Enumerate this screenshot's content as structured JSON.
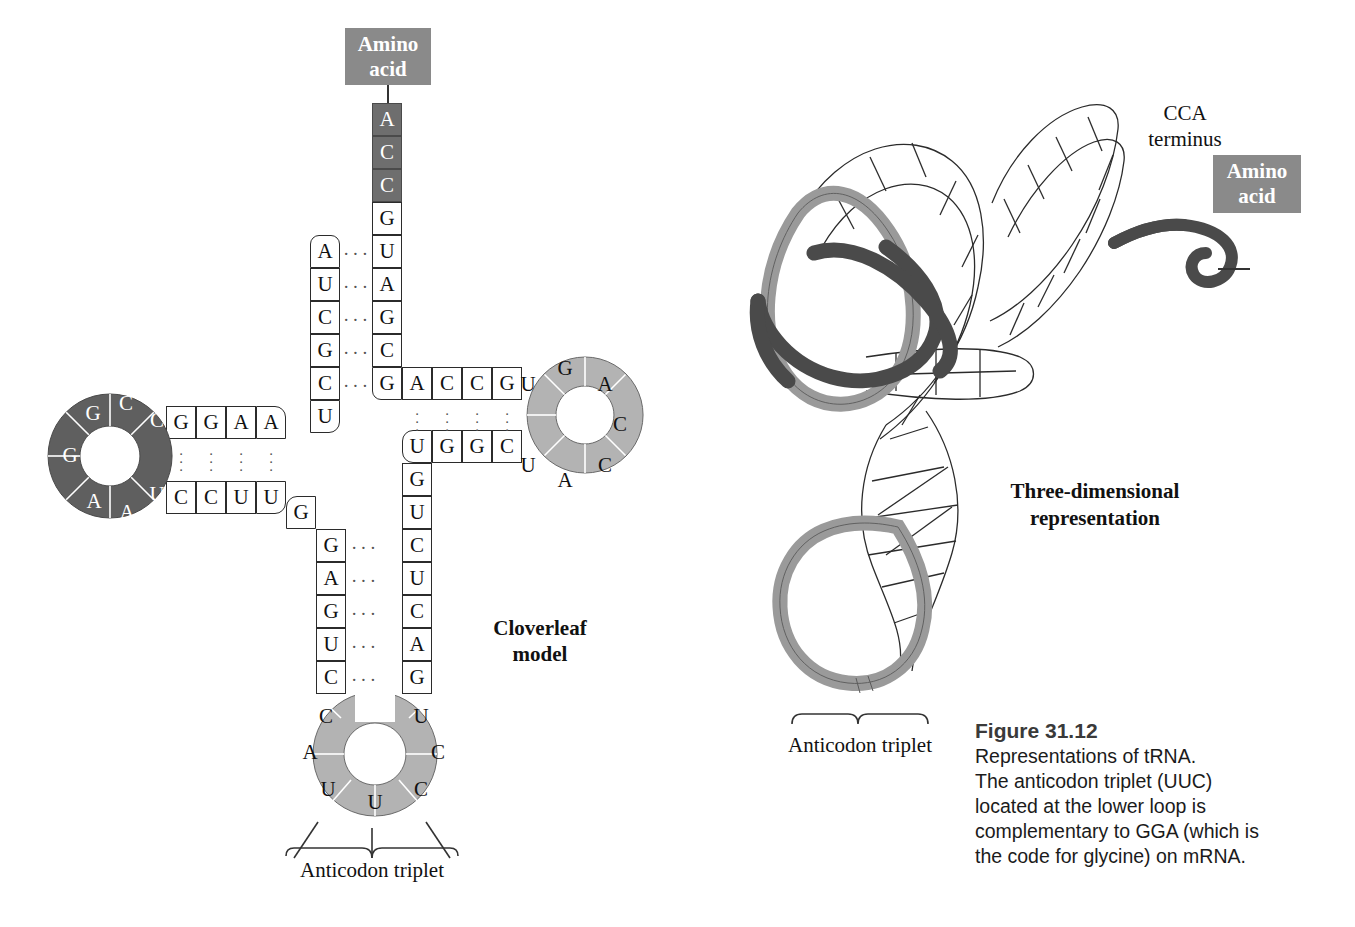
{
  "figure": {
    "number": "Figure 31.12",
    "caption_lines": [
      "Representations of tRNA.",
      "The anticodon triplet (UUC)",
      "located at the lower loop is",
      "complementary to GGA (which is",
      "the code for glycine) on mRNA."
    ]
  },
  "colors": {
    "dark_gray": "#6e6e6e",
    "mid_gray": "#9a9a9a",
    "box_gray": "#8a8a8a",
    "outline": "#2b2b2b",
    "paper": "#ffffff"
  },
  "cloverleaf": {
    "title_line1": "Cloverleaf",
    "title_line2": "model",
    "amino_acid_label_line1": "Amino",
    "amino_acid_label_line2": "acid",
    "anticodon_bracket_label": "Anticodon triplet",
    "acceptor_stem_3prime": [
      "A",
      "C",
      "C",
      "G",
      "U",
      "A",
      "G",
      "C",
      "G"
    ],
    "acceptor_stem_3prime_shaded": [
      true,
      true,
      true,
      false,
      false,
      false,
      false,
      false,
      false
    ],
    "acceptor_stem_5prime": [
      "A",
      "U",
      "C",
      "G",
      "C",
      "U"
    ],
    "d_stem_top": [
      "G",
      "G",
      "A",
      "A"
    ],
    "d_stem_bottom": [
      "C",
      "C",
      "U",
      "U"
    ],
    "d_loop": [
      "G",
      "C",
      "C",
      "C",
      "G",
      "A",
      "A",
      "U"
    ],
    "t_stem_top": [
      "A",
      "C",
      "C",
      "G"
    ],
    "t_stem_bottom": [
      "U",
      "G",
      "G",
      "C"
    ],
    "t_loop": [
      "U",
      "G",
      "A",
      "C",
      "C",
      "A",
      "U"
    ],
    "anticodon_stem_left": [
      "G",
      "G",
      "A",
      "G",
      "U",
      "C"
    ],
    "anticodon_stem_right": [
      "G",
      "U",
      "C",
      "U",
      "C",
      "A",
      "G"
    ],
    "anticodon_loop": [
      "C",
      "A",
      "U",
      "U",
      "C",
      "C",
      "U"
    ],
    "anticodon_triplet": "UUC"
  },
  "three_d": {
    "title_line1": "Three-dimensional",
    "title_line2": "representation",
    "cca_label_line1": "CCA",
    "cca_label_line2": "terminus",
    "amino_acid_label_line1": "Amino",
    "amino_acid_label_line2": "acid",
    "anticodon_bracket_label": "Anticodon triplet"
  }
}
